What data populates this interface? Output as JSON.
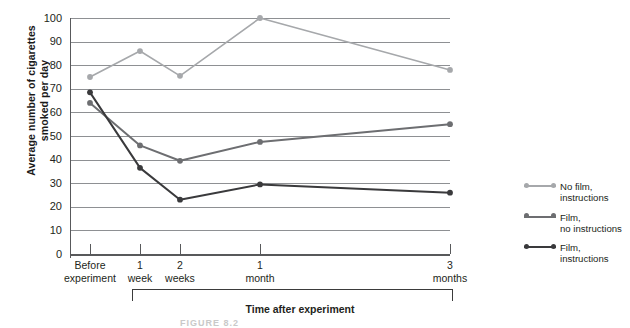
{
  "chart_data": {
    "type": "line",
    "title": "",
    "xlabel": "Time after experiment",
    "ylabel": "Average number of cigarettes smoked per day",
    "categories": [
      "Before experiment",
      "1 week",
      "2 weeks",
      "1 month",
      "3 months"
    ],
    "category_lines": [
      [
        "Before",
        "experiment"
      ],
      [
        "1",
        "week"
      ],
      [
        "2",
        "weeks"
      ],
      [
        "1",
        "month"
      ],
      [
        "3",
        "months"
      ]
    ],
    "x_positions": [
      20,
      70,
      110,
      190,
      380
    ],
    "ylim": [
      0,
      100
    ],
    "yticks": [
      0,
      10,
      20,
      30,
      40,
      50,
      60,
      70,
      80,
      90,
      100
    ],
    "grid": true,
    "legend_position": "right",
    "series": [
      {
        "name": "No film, instructions",
        "name_lines": [
          "No film,",
          "instructions"
        ],
        "color": "#a6a8ab",
        "values": [
          75,
          86,
          75.5,
          100,
          78
        ]
      },
      {
        "name": "Film, no instructions",
        "name_lines": [
          "Film,",
          "no instructions"
        ],
        "color": "#6d6e71",
        "values": [
          64,
          46,
          39.5,
          47.5,
          55
        ]
      },
      {
        "name": "Film, instructions",
        "name_lines": [
          "Film,",
          "instructions"
        ],
        "color": "#3a3a3c",
        "values": [
          68.5,
          36.5,
          23,
          29.5,
          26
        ]
      }
    ]
  },
  "caption": "FIGURE 8.2"
}
